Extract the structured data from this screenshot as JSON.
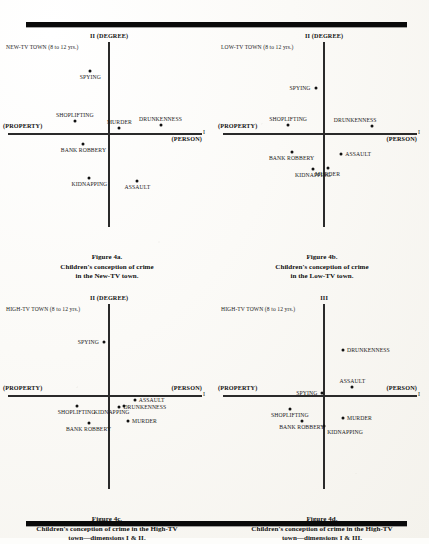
{
  "page": {
    "rules": [
      "top-rule",
      "bottom-rule"
    ]
  },
  "chart_data": [
    {
      "id": "fig-a",
      "type": "scatter",
      "title": "Figure 4a.",
      "caption_lines": [
        "Figure 4a.",
        "Children's conception of crime",
        "in the New-TV town."
      ],
      "town_label": "NEW-TV TOWN (8 to 12 yrs.)",
      "yaxis_label": "II (DEGREE)",
      "xaxis_label": "I",
      "left_pole": "(PROPERTY)",
      "right_pole": "(PERSON)",
      "points": [
        {
          "label": "SPYING",
          "x": -0.22,
          "y": 0.72,
          "label_pos": "below"
        },
        {
          "label": "SHOPLIFTING",
          "x": -0.4,
          "y": 0.14,
          "label_pos": "above"
        },
        {
          "label": "MURDER",
          "x": 0.12,
          "y": 0.06,
          "label_pos": "above"
        },
        {
          "label": "DRUNKENNESS",
          "x": 0.6,
          "y": 0.1,
          "label_pos": "above"
        },
        {
          "label": "BANK ROBBERY",
          "x": -0.3,
          "y": -0.12,
          "label_pos": "below"
        },
        {
          "label": "KIDNAPPING",
          "x": -0.23,
          "y": -0.52,
          "label_pos": "below"
        },
        {
          "label": "ASSAULT",
          "x": 0.33,
          "y": -0.56,
          "label_pos": "below"
        }
      ]
    },
    {
      "id": "fig-b",
      "type": "scatter",
      "title": "Figure 4b.",
      "caption_lines": [
        "Figure 4b.",
        "Children's conception of crime",
        "in the Low-TV town."
      ],
      "town_label": "LOW-TV TOWN (8 to 12 yrs.)",
      "yaxis_label": "II (DEGREE)",
      "xaxis_label": "I",
      "left_pole": "(PROPERTY)",
      "right_pole": "(PERSON)",
      "points": [
        {
          "label": "SPYING",
          "x": -0.1,
          "y": 0.52,
          "label_pos": "left"
        },
        {
          "label": "SHOPLIFTING",
          "x": -0.42,
          "y": 0.1,
          "label_pos": "above"
        },
        {
          "label": "DRUNKENNESS",
          "x": 0.56,
          "y": 0.08,
          "label_pos": "above-left"
        },
        {
          "label": "BANK ROBBERY",
          "x": -0.38,
          "y": -0.22,
          "label_pos": "below"
        },
        {
          "label": "ASSAULT",
          "x": 0.2,
          "y": -0.24,
          "label_pos": "right"
        },
        {
          "label": "KIDNAPPING",
          "x": -0.13,
          "y": -0.42,
          "label_pos": "below"
        },
        {
          "label": "MURDER",
          "x": 0.04,
          "y": -0.4,
          "label_pos": "below"
        }
      ]
    },
    {
      "id": "fig-c",
      "type": "scatter",
      "title": "Figure 4c.",
      "caption_lines": [
        "Figure 4c.",
        "Children's conception of crime in the High-TV",
        "town—dimensions I & II."
      ],
      "town_label": "HIGH-TV TOWN (8 to 12 yrs.)",
      "yaxis_label": "II (DEGREE)",
      "xaxis_label": "I",
      "left_pole": "(PROPERTY)",
      "right_pole": "(PERSON)",
      "points": [
        {
          "label": "SPYING",
          "x": -0.06,
          "y": 0.62,
          "label_pos": "left"
        },
        {
          "label": "ASSAULT",
          "x": 0.3,
          "y": -0.06,
          "label_pos": "right"
        },
        {
          "label": "DRUNKENNESS",
          "x": 0.12,
          "y": -0.14,
          "label_pos": "right"
        },
        {
          "label": "KIDNAPPING",
          "x": 0.17,
          "y": -0.12,
          "label_pos": "below-left"
        },
        {
          "label": "SHOPLIFTING",
          "x": -0.38,
          "y": -0.12,
          "label_pos": "below"
        },
        {
          "label": "MURDER",
          "x": 0.22,
          "y": -0.3,
          "label_pos": "right"
        },
        {
          "label": "BANK ROBBERY",
          "x": -0.24,
          "y": -0.32,
          "label_pos": "below"
        }
      ]
    },
    {
      "id": "fig-d",
      "type": "scatter",
      "title": "Figure 4d.",
      "caption_lines": [
        "Figure 4d.",
        "Children's conception of crime in the High-TV",
        "town—dimensions I & III."
      ],
      "town_label": "HIGH-TV TOWN (8 to 12 yrs.)",
      "yaxis_label": "III",
      "xaxis_label": "I",
      "left_pole": "(PROPERTY)",
      "right_pole": "(PERSON)",
      "points": [
        {
          "label": "DRUNKENNESS",
          "x": 0.22,
          "y": 0.52,
          "label_pos": "right"
        },
        {
          "label": "ASSAULT",
          "x": 0.33,
          "y": 0.1,
          "label_pos": "above"
        },
        {
          "label": "SPYING",
          "x": -0.02,
          "y": 0.02,
          "label_pos": "left"
        },
        {
          "label": "SHOPLIFTING",
          "x": -0.4,
          "y": -0.16,
          "label_pos": "below"
        },
        {
          "label": "MURDER",
          "x": 0.22,
          "y": -0.26,
          "label_pos": "right"
        },
        {
          "label": "BANK ROBBERY",
          "x": -0.26,
          "y": -0.3,
          "label_pos": "below"
        },
        {
          "label": "KIDNAPPING",
          "x": 0.0,
          "y": -0.36,
          "label_pos": "below-right"
        }
      ]
    }
  ]
}
